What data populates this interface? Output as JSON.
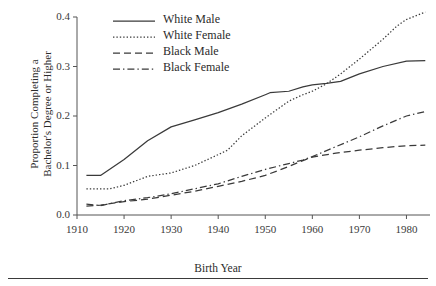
{
  "chart_data": {
    "type": "line",
    "title": "",
    "xlabel": "Birth Year",
    "ylabel": "Proportion Completing a Bachelor's Degree or Higher",
    "ylabel_line1": "Proportion Completing a",
    "ylabel_line2": "Bachelor's Degree or Higher",
    "xlim": [
      1910,
      1985
    ],
    "ylim": [
      0.0,
      0.4
    ],
    "xticks": [
      1910,
      1920,
      1930,
      1940,
      1950,
      1960,
      1970,
      1980
    ],
    "xtick_labels": [
      "1910",
      "1920",
      "1930",
      "1940",
      "1950",
      "1960",
      "1970",
      "1980"
    ],
    "yticks": [
      0.0,
      0.1,
      0.2,
      0.3,
      0.4
    ],
    "ytick_labels": [
      "0.0",
      "0.1",
      "0.2",
      "0.3",
      "0.4"
    ],
    "grid": false,
    "legend_position": "top-center",
    "series": [
      {
        "name": "White Male",
        "style": "solid",
        "color": "#3a3a3a",
        "x": [
          1912,
          1915,
          1920,
          1925,
          1930,
          1935,
          1940,
          1945,
          1950,
          1951,
          1955,
          1958,
          1960,
          1963,
          1966,
          1970,
          1975,
          1980,
          1984
        ],
        "values": [
          0.08,
          0.08,
          0.112,
          0.15,
          0.178,
          0.192,
          0.207,
          0.224,
          0.243,
          0.247,
          0.25,
          0.259,
          0.263,
          0.266,
          0.27,
          0.285,
          0.3,
          0.311,
          0.312
        ]
      },
      {
        "name": "White Female",
        "style": "dotted",
        "color": "#3a3a3a",
        "x": [
          1912,
          1917,
          1920,
          1925,
          1930,
          1935,
          1940,
          1942,
          1945,
          1950,
          1955,
          1958,
          1960,
          1963,
          1966,
          1970,
          1975,
          1978,
          1980,
          1984
        ],
        "values": [
          0.053,
          0.053,
          0.06,
          0.078,
          0.085,
          0.1,
          0.122,
          0.131,
          0.16,
          0.196,
          0.23,
          0.243,
          0.25,
          0.265,
          0.285,
          0.315,
          0.355,
          0.382,
          0.395,
          0.41
        ]
      },
      {
        "name": "Black Male",
        "style": "dashed",
        "color": "#3a3a3a",
        "x": [
          1912,
          1915,
          1920,
          1925,
          1930,
          1935,
          1940,
          1945,
          1950,
          1955,
          1958,
          1960,
          1965,
          1970,
          1975,
          1980,
          1984
        ],
        "values": [
          0.018,
          0.02,
          0.027,
          0.032,
          0.04,
          0.048,
          0.058,
          0.068,
          0.08,
          0.098,
          0.11,
          0.117,
          0.125,
          0.131,
          0.136,
          0.14,
          0.141
        ]
      },
      {
        "name": "Black Female",
        "style": "dashdot",
        "color": "#3a3a3a",
        "x": [
          1912,
          1915,
          1920,
          1925,
          1930,
          1935,
          1940,
          1945,
          1950,
          1955,
          1958,
          1960,
          1965,
          1970,
          1975,
          1980,
          1984
        ],
        "values": [
          0.022,
          0.019,
          0.029,
          0.035,
          0.043,
          0.053,
          0.063,
          0.078,
          0.092,
          0.104,
          0.111,
          0.118,
          0.138,
          0.158,
          0.18,
          0.2,
          0.209
        ]
      }
    ]
  },
  "legend": {
    "items": [
      {
        "label": "White Male"
      },
      {
        "label": "White Female"
      },
      {
        "label": "Black Male"
      },
      {
        "label": "Black Female"
      }
    ]
  }
}
